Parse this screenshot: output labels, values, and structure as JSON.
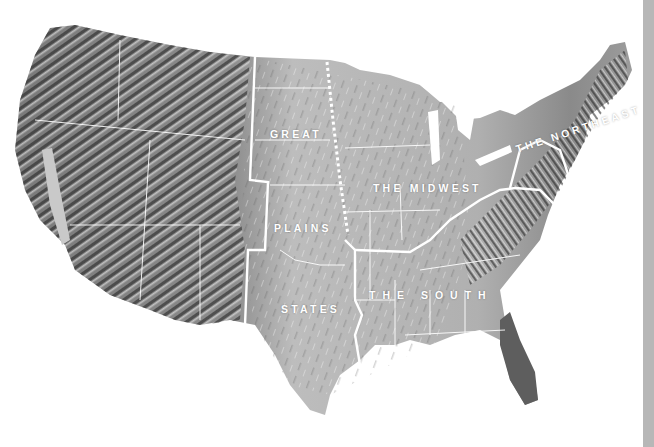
{
  "map": {
    "type": "shaded-relief",
    "subject": "contiguous United States",
    "colors": {
      "background": "#ffffff",
      "mountains_dark": "#2a2a2a",
      "relief_mid": "#9a9a9a",
      "plains_light": "#c4c4c4",
      "florida": "#5e5e5e",
      "boundary": "#ffffff",
      "edge_strip": "#b7b7b7"
    },
    "regions": [
      {
        "id": "great-plains",
        "label_lines": [
          "GREAT",
          "PLAINS",
          "STATES"
        ]
      },
      {
        "id": "midwest",
        "label": "THE MIDWEST"
      },
      {
        "id": "northeast",
        "label": "THE NORTHEAST"
      },
      {
        "id": "south",
        "label": "THE SOUTH"
      }
    ],
    "boundary_styles": {
      "region": "solid white thick",
      "state": "solid white thin",
      "great_plains_midwest": "dotted white"
    }
  }
}
